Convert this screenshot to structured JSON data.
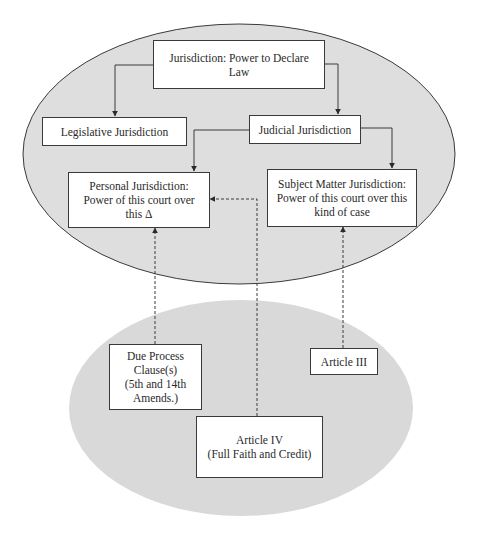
{
  "diagram": {
    "upper_region": {
      "root": "Jurisdiction: Power to Declare\nLaw",
      "legislative": "Legislative Jurisdiction",
      "judicial": "Judicial Jurisdiction",
      "personal": "Personal  Jurisdiction:\nPower of this court over\nthis Δ",
      "subject_matter": "Subject Matter Jurisdiction:\nPower of this court over this\nkind of case"
    },
    "lower_region": {
      "due_process": "Due Process\nClause(s)\n(5th and 14th\nAmends.)",
      "article_iii": "Article  III",
      "article_iv": "Article  IV\n(Full Faith and Credit)"
    },
    "edges": [
      {
        "from": "root",
        "to": "legislative",
        "style": "solid"
      },
      {
        "from": "root",
        "to": "judicial",
        "style": "solid"
      },
      {
        "from": "judicial",
        "to": "personal",
        "style": "solid"
      },
      {
        "from": "judicial",
        "to": "subject_matter",
        "style": "solid"
      },
      {
        "from": "due_process",
        "to": "personal",
        "style": "dashed"
      },
      {
        "from": "article_iv",
        "to": "personal",
        "style": "dashed"
      },
      {
        "from": "article_iii",
        "to": "subject_matter",
        "style": "dashed"
      }
    ],
    "colors": {
      "upper_fill": "#dedede",
      "lower_fill": "#d9d9d9",
      "stroke": "#3a3a3a"
    }
  }
}
